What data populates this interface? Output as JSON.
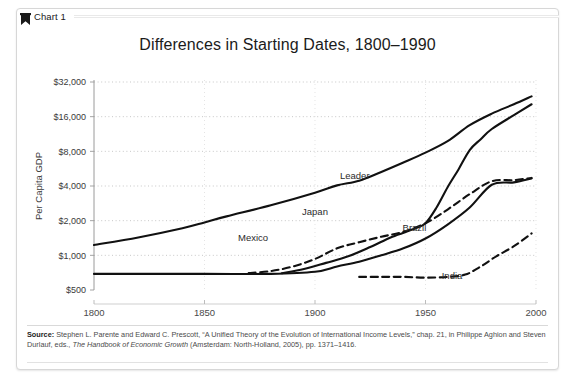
{
  "card": {
    "tab": {
      "icon": "bookmark-icon",
      "label": "Chart 1"
    }
  },
  "chart_data": {
    "type": "line",
    "title": "Differences in Starting Dates, 1800–1990",
    "xlabel": "",
    "ylabel": "Per Capita GDP",
    "scale": "log2",
    "grid": true,
    "legend_position": "inline-labels",
    "xlim": [
      1800,
      2000
    ],
    "ylim": [
      500,
      32000
    ],
    "xticks": [
      1800,
      1850,
      1900,
      1950,
      2000
    ],
    "xtick_labels": [
      "1800",
      "1850",
      "1900",
      "1950",
      "2000"
    ],
    "yticks": [
      500,
      1000,
      2000,
      4000,
      8000,
      16000,
      32000
    ],
    "ytick_labels": [
      "$500",
      "$1,000",
      "$2,000",
      "$4,000",
      "$8,000",
      "$16,000",
      "$32,000"
    ],
    "series": [
      {
        "name": "Leader",
        "style": "solid",
        "label_x": 1918,
        "label_y": 4600,
        "x": [
          1800,
          1820,
          1840,
          1850,
          1860,
          1880,
          1900,
          1910,
          1920,
          1930,
          1940,
          1950,
          1960,
          1970,
          1980,
          1990,
          1998
        ],
        "values": [
          1230,
          1430,
          1720,
          1930,
          2180,
          2720,
          3500,
          4050,
          4450,
          5300,
          6400,
          7800,
          9800,
          13500,
          17000,
          20500,
          24000
        ]
      },
      {
        "name": "Japan",
        "style": "solid",
        "label_x": 1900,
        "label_y": 2250,
        "x": [
          1885,
          1895,
          1905,
          1915,
          1925,
          1935,
          1945,
          1950,
          1955,
          1960,
          1965,
          1970,
          1975,
          1980,
          1990,
          1998
        ],
        "values": [
          700,
          760,
          860,
          980,
          1180,
          1450,
          1700,
          1900,
          2600,
          3900,
          5600,
          8200,
          10200,
          12500,
          16500,
          20500
        ]
      },
      {
        "name": "Mexico",
        "style": "dashed",
        "label_x": 1872,
        "label_y": 1320,
        "x": [
          1870,
          1880,
          1890,
          1900,
          1910,
          1920,
          1930,
          1940,
          1950,
          1960,
          1970,
          1980,
          1990,
          1998
        ],
        "values": [
          700,
          730,
          800,
          930,
          1150,
          1300,
          1450,
          1600,
          1900,
          2500,
          3400,
          4400,
          4500,
          4700
        ]
      },
      {
        "name": "Brazil",
        "style": "solid",
        "label_x": 1945,
        "label_y": 1620,
        "x": [
          1800,
          1850,
          1880,
          1900,
          1910,
          1920,
          1930,
          1940,
          1950,
          1960,
          1970,
          1980,
          1990,
          1998
        ],
        "values": [
          690,
          690,
          690,
          720,
          800,
          880,
          1000,
          1150,
          1400,
          1850,
          2600,
          4100,
          4300,
          4650
        ]
      },
      {
        "name": "India",
        "style": "dashed",
        "label_x": 1962,
        "label_y": 620,
        "x": [
          1920,
          1930,
          1940,
          1950,
          1960,
          1968,
          1975,
          1982,
          1990,
          1998
        ],
        "values": [
          650,
          650,
          650,
          640,
          650,
          680,
          800,
          980,
          1200,
          1550
        ]
      }
    ]
  },
  "source": {
    "prefix": "Source:",
    "line1_a": " Stephen L. Parente and Edward C. Prescott, “A Unified Theory of the Evolution of International Income Levels,” chap. 21, in Philippe Aghion and Steven Durlauf, eds., ",
    "italic": "The Handbook of Economic Growth",
    "line1_b": " (Amsterdam: North-Holland, 2005), pp. 1371–1416."
  }
}
